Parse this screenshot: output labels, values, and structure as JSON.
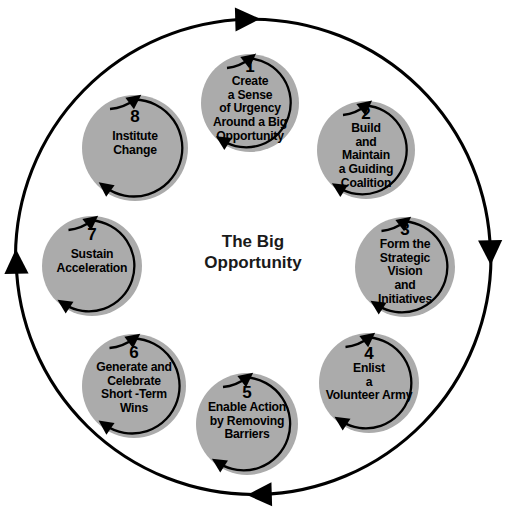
{
  "diagram": {
    "title": "The Big Opportunity",
    "center_label_lines": "The Big\nOpportunity",
    "outer_ring": {
      "name": "outer-cycle-ring",
      "direction": "clockwise",
      "arrowhead_count": 4,
      "arrowheads": [
        "top-pointing-right",
        "right-pointing-down",
        "bottom-pointing-left",
        "left-pointing-up"
      ],
      "stroke_color": "#000000"
    },
    "style": {
      "node_fill": "#ababab",
      "node_stroke": "none",
      "text_color": "#000000",
      "background": "#ffffff",
      "arrow_color": "#000000"
    },
    "nodes": [
      {
        "number": "1",
        "label": "Create\na Sense\nof Urgency\nAround a Big\nOpportunity",
        "cx": 250,
        "cy": 103,
        "r": 49,
        "font_size": 12.2,
        "num_dy": -36,
        "text_dy": 7
      },
      {
        "number": "2",
        "label": "Build\nand\nMaintain\na Guiding\nCoalition",
        "cx": 366,
        "cy": 150,
        "r": 49,
        "font_size": 12.2,
        "num_dy": -36,
        "text_dy": 7
      },
      {
        "number": "3",
        "label": "Form the\nStrategic\nVision\nand\nInitiatives",
        "cx": 405,
        "cy": 267,
        "r": 50,
        "font_size": 12.2,
        "num_dy": -37,
        "text_dy": 7
      },
      {
        "number": "4",
        "label": "Enlist\na\nVolunteer Army",
        "cx": 369,
        "cy": 383,
        "r": 50,
        "font_size": 12.2,
        "num_dy": -30,
        "text_dy": 9
      },
      {
        "number": "5",
        "label": "Enable Action\nby Removing\nBarriers",
        "cx": 247,
        "cy": 424,
        "r": 51,
        "font_size": 12.2,
        "num_dy": -32,
        "text_dy": 9
      },
      {
        "number": "6",
        "label": "Generate and\nCelebrate\nShort -Term\nWins",
        "cx": 134,
        "cy": 386,
        "r": 52,
        "font_size": 12.2,
        "num_dy": -35,
        "text_dy": 8
      },
      {
        "number": "7",
        "label": "Sustain\nAcceleration",
        "cx": 92,
        "cy": 266,
        "r": 50,
        "font_size": 12.2,
        "num_dy": -32,
        "text_dy": 11
      },
      {
        "number": "8",
        "label": "Institute\nChange",
        "cx": 135,
        "cy": 148,
        "r": 53,
        "font_size": 12.2,
        "num_dy": -34,
        "text_dy": 11
      }
    ]
  }
}
